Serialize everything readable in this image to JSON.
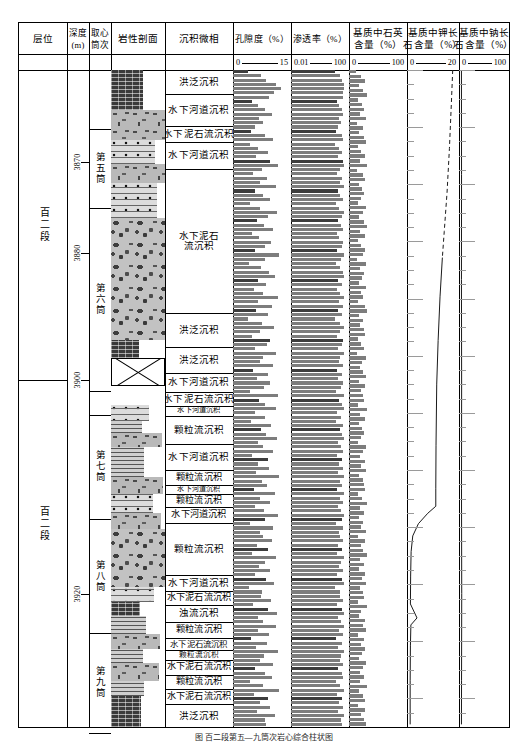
{
  "figure": {
    "caption": "图 百二段第五—九筒次岩心综合柱状图"
  },
  "columns": [
    {
      "id": "horizon",
      "title_lines": [
        "层位"
      ]
    },
    {
      "id": "depth",
      "title_lines": [
        "深度",
        "(m)"
      ]
    },
    {
      "id": "core_run",
      "title_lines": [
        "取心",
        "筒次"
      ]
    },
    {
      "id": "lithology",
      "title_lines": [
        "岩性剖面"
      ]
    },
    {
      "id": "facies",
      "title_lines": [
        "沉积微相"
      ]
    },
    {
      "id": "porosity",
      "title_lines": [
        "孔隙度（%）"
      ],
      "scale": {
        "min": "0",
        "max": "15"
      }
    },
    {
      "id": "perm",
      "title_lines": [
        "渗透率（%）"
      ],
      "scale": {
        "min": "0.01",
        "max": "100"
      }
    },
    {
      "id": "quartz",
      "title_lines": [
        "基质中石英",
        "含量（%）"
      ],
      "scale": {
        "min": "0",
        "max": "100"
      }
    },
    {
      "id": "kfeldspar",
      "title_lines": [
        "基质中钾长",
        "石含量（%）"
      ],
      "scale": {
        "min": "0",
        "max": "20"
      }
    },
    {
      "id": "nafeldspar",
      "title_lines": [
        "基质中钠长",
        "石含量（%）"
      ],
      "scale": {
        "min": "0",
        "max": "100"
      }
    }
  ],
  "horizon": [
    {
      "label": "百二段",
      "top": 0,
      "height": 355
    },
    {
      "label": "百二段",
      "top": 355,
      "height": 330
    }
  ],
  "depth_ticks": [
    {
      "label": "3870",
      "y": 105
    },
    {
      "label": "3880",
      "y": 210
    },
    {
      "label": "3900",
      "y": 355
    },
    {
      "label": "3920",
      "y": 600
    }
  ],
  "core_runs": [
    {
      "label": "第五筒",
      "top": 68,
      "height": 90
    },
    {
      "label": "第六筒",
      "top": 158,
      "height": 210
    },
    {
      "label": "第七筒",
      "top": 395,
      "height": 120
    },
    {
      "label": "第八筒",
      "top": 515,
      "height": 130
    },
    {
      "label": "第九筒",
      "top": 645,
      "height": 115
    }
  ],
  "facies": [
    {
      "label": "洪泛沉积",
      "top": 0,
      "height": 28,
      "size": 9.5
    },
    {
      "label": "水下河道沉积",
      "top": 28,
      "height": 36,
      "size": 9.5
    },
    {
      "label": "水下泥石流沉积",
      "top": 64,
      "height": 18,
      "size": 9.5
    },
    {
      "label": "水下河道沉积",
      "top": 82,
      "height": 32,
      "size": 9.5
    },
    {
      "label": "水下泥石\n流沉积",
      "top": 114,
      "height": 165,
      "size": 9.5,
      "two": true
    },
    {
      "label": "洪泛沉积",
      "top": 279,
      "height": 38,
      "size": 9.5
    },
    {
      "label": "洪泛沉积",
      "top": 317,
      "height": 30,
      "size": 9.5
    },
    {
      "label": "水下河道沉积",
      "top": 347,
      "height": 22,
      "size": 9.5
    },
    {
      "label": "水下泥石流沉积",
      "top": 369,
      "height": 16,
      "size": 9.5
    },
    {
      "label": "水下河道沉积",
      "top": 385,
      "height": 11,
      "size": 7.2
    },
    {
      "label": "颗粒流沉积",
      "top": 396,
      "height": 33,
      "size": 9.5
    },
    {
      "label": "水下河道沉积",
      "top": 429,
      "height": 30,
      "size": 9.5
    },
    {
      "label": "颗粒流沉积",
      "top": 459,
      "height": 17,
      "size": 9.2
    },
    {
      "label": "水下河道沉积",
      "top": 476,
      "height": 10,
      "size": 7.0
    },
    {
      "label": "颗粒流沉积",
      "top": 486,
      "height": 15,
      "size": 9.0
    },
    {
      "label": "水下河道沉积",
      "top": 501,
      "height": 18,
      "size": 9.2
    },
    {
      "label": "颗粒流沉积",
      "top": 519,
      "height": 60,
      "size": 9.5
    },
    {
      "label": "水下河道沉积",
      "top": 579,
      "height": 18,
      "size": 9.5
    },
    {
      "label": "水下泥石流沉积",
      "top": 597,
      "height": 16,
      "size": 9.2
    },
    {
      "label": "浊流沉积",
      "top": 613,
      "height": 20,
      "size": 9.5
    },
    {
      "label": "颗粒流沉积",
      "top": 633,
      "height": 18,
      "size": 9.2
    },
    {
      "label": "水下泥石流沉积",
      "top": 651,
      "height": 14,
      "size": 8.4
    },
    {
      "label": "颗粒流沉积",
      "top": 665,
      "height": 11,
      "size": 7.6
    },
    {
      "label": "水下泥石流沉积",
      "top": 676,
      "height": 17,
      "size": 9.2
    },
    {
      "label": "颗粒流沉积",
      "top": 693,
      "height": 17,
      "size": 9.2
    },
    {
      "label": "水下泥石流沉积",
      "top": 710,
      "height": 17,
      "size": 9.2
    },
    {
      "label": "洪泛沉积",
      "top": 727,
      "height": 26,
      "size": 9.5
    }
  ],
  "lithology": [
    {
      "pattern": "p-mud",
      "top": 0,
      "height": 46,
      "w": 60
    },
    {
      "pattern": "p-grav",
      "top": 46,
      "height": 34,
      "w": 100
    },
    {
      "pattern": "p-sand-dot",
      "top": 80,
      "height": 28,
      "w": 82
    },
    {
      "pattern": "p-grav",
      "top": 108,
      "height": 22,
      "w": 100
    },
    {
      "pattern": "p-sand-dot",
      "top": 130,
      "height": 40,
      "w": 86
    },
    {
      "pattern": "p-congl",
      "top": 170,
      "height": 140,
      "w": 100
    },
    {
      "pattern": "p-mud",
      "top": 310,
      "height": 20,
      "w": 52
    },
    {
      "pattern": "p-cross",
      "top": 330,
      "height": 32,
      "w": 100
    },
    {
      "pattern": "p-white",
      "top": 362,
      "height": 22,
      "w": 100
    },
    {
      "pattern": "p-sand-dot",
      "top": 384,
      "height": 18,
      "w": 70
    },
    {
      "pattern": "p-silt",
      "top": 402,
      "height": 14,
      "w": 58
    },
    {
      "pattern": "p-grav",
      "top": 416,
      "height": 16,
      "w": 94
    },
    {
      "pattern": "p-silt",
      "top": 432,
      "height": 34,
      "w": 62
    },
    {
      "pattern": "p-grav",
      "top": 466,
      "height": 20,
      "w": 96
    },
    {
      "pattern": "p-sand-dot",
      "top": 486,
      "height": 22,
      "w": 78
    },
    {
      "pattern": "p-grav",
      "top": 508,
      "height": 18,
      "w": 92
    },
    {
      "pattern": "p-congl",
      "top": 526,
      "height": 66,
      "w": 100
    },
    {
      "pattern": "p-sand-dot",
      "top": 592,
      "height": 18,
      "w": 80
    },
    {
      "pattern": "p-mud",
      "top": 610,
      "height": 16,
      "w": 54
    },
    {
      "pattern": "p-silt",
      "top": 626,
      "height": 20,
      "w": 64
    },
    {
      "pattern": "p-grav",
      "top": 646,
      "height": 18,
      "w": 90
    },
    {
      "pattern": "p-silt",
      "top": 664,
      "height": 16,
      "w": 60
    },
    {
      "pattern": "p-grav",
      "top": 680,
      "height": 20,
      "w": 88
    },
    {
      "pattern": "p-silt",
      "top": 700,
      "height": 18,
      "w": 62
    },
    {
      "pattern": "p-mud",
      "top": 718,
      "height": 35,
      "w": 56
    }
  ],
  "chart_data": [
    {
      "id": "porosity",
      "type": "bar",
      "title": "孔隙度（%）",
      "orientation": "horizontal",
      "xlabel": "孔隙度 (%)",
      "ylabel": "深度 (m)",
      "xlim": [
        0,
        15
      ],
      "grid": false,
      "values": [
        4.1,
        7.8,
        9.2,
        12.0,
        13.2,
        11.5,
        10.0,
        5.2,
        6.8,
        9.0,
        10.8,
        7.2,
        8.4,
        6.0,
        5.0,
        8.8,
        11.0,
        4.6,
        7.0,
        9.6,
        6.4,
        10.2,
        12.6,
        8.0,
        5.6,
        9.4,
        7.6,
        11.8,
        6.2,
        8.2,
        10.4,
        4.8,
        7.4,
        12.2,
        9.8,
        6.6,
        8.6,
        11.2,
        5.4,
        7.2,
        10.6,
        9.0,
        6.0,
        12.8,
        8.8,
        4.4,
        7.8,
        10.0,
        11.6,
        6.8,
        9.2,
        5.8,
        8.4,
        12.4,
        7.0,
        10.8,
        6.4,
        9.6,
        4.2,
        8.0,
        11.4,
        7.6,
        5.2,
        10.2,
        9.4,
        6.2,
        12.0,
        8.2,
        7.4,
        11.0,
        5.6,
        9.8,
        6.6,
        10.4,
        8.6,
        4.6,
        12.6,
        7.2,
        9.0,
        11.8,
        6.0,
        8.8,
        5.0,
        10.6,
        7.8,
        9.2,
        12.2,
        6.8,
        8.4,
        11.2,
        5.4,
        9.6,
        7.0,
        10.0,
        6.4,
        12.8,
        8.0,
        9.4,
        5.8,
        11.6,
        7.6,
        10.2,
        6.2,
        8.6,
        12.4,
        9.0,
        4.8,
        11.0,
        7.4,
        8.2,
        10.8,
        6.6,
        9.8,
        5.2,
        12.0,
        8.8,
        7.2,
        10.4,
        6.0,
        9.2,
        11.4,
        4.4,
        8.0,
        7.8,
        10.6,
        5.6,
        9.6,
        12.2,
        6.8,
        8.4,
        11.8,
        7.0,
        10.0,
        5.0,
        9.4,
        6.4,
        12.6,
        8.6,
        7.6,
        11.2,
        6.2,
        9.0,
        10.8,
        4.6,
        8.2,
        12.8,
        5.8,
        9.8,
        7.4,
        10.2,
        6.6,
        11.6,
        8.8,
        9.2
      ]
    },
    {
      "id": "perm",
      "type": "bar",
      "title": "渗透率（%）",
      "orientation": "horizontal",
      "xlabel": "渗透率 (%)",
      "xlim": [
        0.01,
        100
      ],
      "scale": "log",
      "grid": false,
      "values": [
        18,
        45,
        62,
        80,
        88,
        74,
        66,
        24,
        36,
        58,
        71,
        33,
        47,
        28,
        21,
        55,
        76,
        19,
        34,
        63,
        30,
        69,
        84,
        42,
        26,
        61,
        40,
        82,
        29,
        44,
        70,
        22,
        38,
        85,
        64,
        31,
        48,
        75,
        25,
        35,
        72,
        57,
        27,
        87,
        54,
        20,
        46,
        65,
        79,
        32,
        59,
        26,
        45,
        86,
        33,
        73,
        30,
        62,
        18,
        41,
        77,
        39,
        24,
        68,
        60,
        28,
        81,
        43,
        37,
        74,
        26,
        64,
        31,
        71,
        50,
        20,
        84,
        34,
        56,
        80,
        27,
        52,
        23,
        72,
        46,
        58,
        83,
        32,
        47,
        76,
        25,
        63,
        33,
        66,
        29,
        87,
        42,
        61,
        27,
        79,
        40,
        68,
        28,
        49,
        85,
        57,
        22,
        74,
        36,
        44,
        73,
        31,
        64,
        24,
        81,
        52,
        34,
        70,
        27,
        58,
        78,
        19,
        41,
        46,
        72,
        26,
        63,
        82,
        32,
        48,
        80,
        33,
        65,
        23,
        60,
        29,
        86,
        50,
        39,
        76,
        28,
        56,
        73,
        20,
        44,
        88,
        26,
        64,
        36,
        67,
        31,
        78,
        54,
        59
      ]
    },
    {
      "id": "quartz",
      "type": "bar",
      "title": "基质中石英含量（%）",
      "orientation": "horizontal",
      "xlabel": "基质中石英含量 (%)",
      "xlim": [
        0,
        100
      ],
      "grid": false,
      "values": [
        12,
        22,
        30,
        18,
        26,
        34,
        16,
        24,
        28,
        20,
        32,
        14,
        25,
        19,
        27,
        31,
        17,
        23,
        29,
        21,
        33,
        15,
        26,
        30,
        18,
        24,
        28,
        22,
        16,
        31,
        25,
        19,
        27,
        33,
        21,
        29,
        17,
        23,
        30,
        26,
        14,
        32,
        20,
        28,
        24,
        18,
        31,
        22,
        26,
        16,
        29,
        33,
        19,
        25,
        21,
        27,
        30,
        17,
        23,
        28,
        15,
        32,
        24,
        20,
        26,
        31,
        18,
        29,
        22,
        25,
        27,
        16,
        33,
        21,
        30,
        19,
        24,
        28,
        23,
        17,
        31,
        26,
        20,
        29,
        22,
        32,
        18,
        25,
        27,
        30,
        16,
        24,
        33,
        21,
        28,
        19,
        26,
        23,
        31,
        17,
        29,
        22,
        25,
        34,
        20,
        27,
        18,
        30,
        24,
        32,
        21,
        26,
        28,
        16,
        33,
        23,
        19,
        29,
        25,
        31,
        17,
        27,
        22,
        30,
        24,
        18,
        32,
        26,
        20,
        28,
        21,
        33,
        19,
        25,
        30,
        16,
        29,
        23,
        27,
        31
      ]
    },
    {
      "id": "kfeldspar",
      "type": "line",
      "title": "基质中钾长石含量（%）",
      "xlabel": "基质中钾长石含量 (%)",
      "xlim": [
        0,
        20
      ],
      "grid": false,
      "notes": "dashed above ~3875 m, solid below; sharp decrease to near 0 at ~3900 m",
      "points": [
        {
          "y": 0,
          "x": 18.6,
          "dashed": true
        },
        {
          "y": 40,
          "x": 18.0,
          "dashed": true
        },
        {
          "y": 90,
          "x": 17.2,
          "dashed": true
        },
        {
          "y": 140,
          "x": 16.2,
          "dashed": true
        },
        {
          "y": 185,
          "x": 15.0,
          "dashed": true
        },
        {
          "y": 215,
          "x": 14.2,
          "dashed": false
        },
        {
          "y": 260,
          "x": 13.2,
          "dashed": false
        },
        {
          "y": 310,
          "x": 12.4,
          "dashed": false
        },
        {
          "y": 360,
          "x": 11.8,
          "dashed": false
        },
        {
          "y": 430,
          "x": 11.5,
          "dashed": false
        },
        {
          "y": 480,
          "x": 11.4,
          "dashed": false
        },
        {
          "y": 500,
          "x": 11.4,
          "dashed": false
        },
        {
          "y": 508,
          "x": 8.0,
          "dashed": false
        },
        {
          "y": 520,
          "x": 4.0,
          "dashed": false
        },
        {
          "y": 534,
          "x": 1.6,
          "dashed": false
        },
        {
          "y": 552,
          "x": 0.9,
          "dashed": false
        },
        {
          "y": 580,
          "x": 0.7,
          "dashed": false
        },
        {
          "y": 612,
          "x": 0.6,
          "dashed": false
        },
        {
          "y": 628,
          "x": 3.4,
          "dashed": false
        },
        {
          "y": 636,
          "x": 0.8,
          "dashed": false
        },
        {
          "y": 660,
          "x": 0.6,
          "dashed": false
        },
        {
          "y": 700,
          "x": 0.5,
          "dashed": false
        },
        {
          "y": 750,
          "x": 0.5,
          "dashed": false
        }
      ]
    },
    {
      "id": "nafeldspar",
      "type": "line",
      "title": "基质中钠长石含量（%）",
      "xlabel": "基质中钠长石含量 (%)",
      "xlim": [
        0,
        100
      ],
      "grid": false,
      "notes": "near-zero throughout with small spikes",
      "points": [
        {
          "y": 0,
          "x": 1.0
        },
        {
          "y": 120,
          "x": 1.2
        },
        {
          "y": 240,
          "x": 1.0
        },
        {
          "y": 360,
          "x": 1.4
        },
        {
          "y": 480,
          "x": 1.1
        },
        {
          "y": 600,
          "x": 1.6
        },
        {
          "y": 700,
          "x": 1.2
        },
        {
          "y": 750,
          "x": 1.0
        }
      ]
    }
  ]
}
